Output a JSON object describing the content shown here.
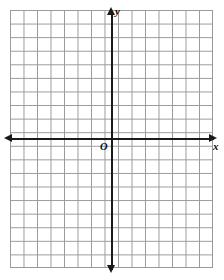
{
  "figure": {
    "type": "blank-cartesian-coordinate-grid",
    "title": "",
    "origin_label": "O",
    "x_axis_label": "x",
    "y_axis_label": "y"
  },
  "colors": {
    "background": "#ffffff",
    "grid_line": "#999999",
    "axis_line": "#1a1a1a",
    "label_text": "#0d0d0d"
  },
  "chart_data": {
    "type": "scatter",
    "title": "",
    "xlabel": "x",
    "ylabel": "y",
    "origin_label": "O",
    "grid": true,
    "legend": null,
    "series": [],
    "x": [],
    "values": [],
    "xlim": [
      -7.5,
      7.5
    ],
    "ylim": [
      -9.5,
      9.5
    ],
    "grid_columns": 15,
    "grid_rows": 19,
    "x_tick_labels": [],
    "y_tick_labels": [],
    "annotations": [
      {
        "text": "y",
        "position": "top-of-y-axis"
      },
      {
        "text": "x",
        "position": "right-of-x-axis"
      },
      {
        "text": "O",
        "position": "origin"
      }
    ],
    "axis_arrows": [
      "up",
      "down",
      "left",
      "right"
    ]
  }
}
